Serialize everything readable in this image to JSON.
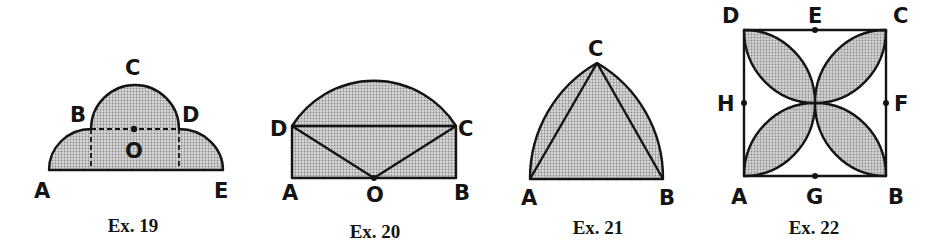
{
  "figures": [
    {
      "id": "ex19",
      "caption": "Ex. 19",
      "labels": {
        "A": "A",
        "B": "B",
        "C": "C",
        "D": "D",
        "E": "E",
        "O": "O"
      },
      "description": "Semicircle on BD centered at O atop a dashed rectangle, flanked by two shaded quarter circles down to A and E"
    },
    {
      "id": "ex20",
      "caption": "Ex. 20",
      "labels": {
        "A": "A",
        "B": "B",
        "C": "C",
        "D": "D",
        "O": "O"
      },
      "description": "Rectangle ABCD with arc DC centered at O (midpoint of AB), segments OD and OC and diagonal DC drawn"
    },
    {
      "id": "ex21",
      "caption": "Ex. 21",
      "labels": {
        "A": "A",
        "B": "B",
        "C": "C"
      },
      "description": "Equilateral triangle ABC with circular arcs AC and BC (Reuleaux-type) shaded"
    },
    {
      "id": "ex22",
      "caption": "Ex. 22",
      "labels": {
        "A": "A",
        "B": "B",
        "C": "C",
        "D": "D",
        "E": "E",
        "F": "F",
        "G": "G",
        "H": "H"
      },
      "description": "Square ABCD with midpoints E, F, G, H; four shaded lens-shaped petals from corners to center"
    }
  ],
  "colors": {
    "ink": "#141414",
    "fill_light": "#c4c4c4",
    "fill_dot": "#8a8a8a",
    "background": "#ffffff"
  }
}
